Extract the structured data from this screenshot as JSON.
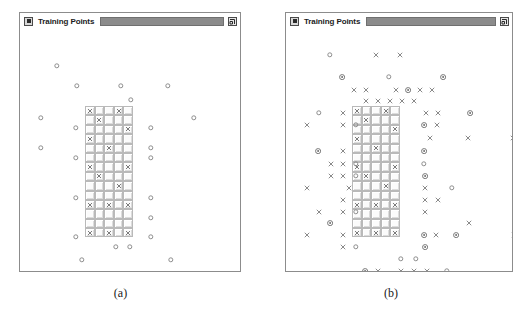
{
  "figure": {
    "panels": [
      {
        "id": "panel-a",
        "caption": "(a)",
        "window": {
          "title": "Training Points",
          "system_button_icon": "square-icon",
          "resize_button_icon": "restore-window-icon"
        },
        "grid": {
          "cols": 5,
          "rows": 14,
          "x_cells": [
            [
              1,
              0,
              0,
              1,
              0
            ],
            [
              0,
              1,
              0,
              0,
              0
            ],
            [
              0,
              0,
              0,
              0,
              1
            ],
            [
              1,
              0,
              0,
              0,
              0
            ],
            [
              0,
              0,
              1,
              0,
              0
            ],
            [
              0,
              0,
              0,
              0,
              0
            ],
            [
              1,
              0,
              0,
              0,
              1
            ],
            [
              0,
              1,
              0,
              0,
              0
            ],
            [
              0,
              0,
              0,
              1,
              0
            ],
            [
              0,
              0,
              0,
              0,
              0
            ],
            [
              1,
              0,
              1,
              0,
              1
            ],
            [
              0,
              0,
              0,
              0,
              0
            ],
            [
              0,
              0,
              0,
              0,
              0
            ],
            [
              1,
              0,
              1,
              0,
              1
            ]
          ]
        },
        "markers": [
          {
            "type": "circle",
            "x": 37,
            "y": 38
          },
          {
            "type": "circle",
            "x": 57,
            "y": 58
          },
          {
            "type": "circle",
            "x": 101,
            "y": 58
          },
          {
            "type": "circle",
            "x": 148,
            "y": 58
          },
          {
            "type": "circle",
            "x": 111,
            "y": 72
          },
          {
            "type": "circle",
            "x": 21,
            "y": 90
          },
          {
            "type": "circle",
            "x": 174,
            "y": 90
          },
          {
            "type": "circle",
            "x": 56,
            "y": 100
          },
          {
            "type": "circle",
            "x": 131,
            "y": 100
          },
          {
            "type": "circle",
            "x": 21,
            "y": 120
          },
          {
            "type": "circle",
            "x": 131,
            "y": 120
          },
          {
            "type": "circle",
            "x": 56,
            "y": 130
          },
          {
            "type": "circle",
            "x": 131,
            "y": 130
          },
          {
            "type": "circle",
            "x": 56,
            "y": 170
          },
          {
            "type": "circle",
            "x": 131,
            "y": 170
          },
          {
            "type": "circle",
            "x": 131,
            "y": 190
          },
          {
            "type": "circle",
            "x": 56,
            "y": 209
          },
          {
            "type": "circle",
            "x": 131,
            "y": 209
          },
          {
            "type": "circle",
            "x": 96,
            "y": 219
          },
          {
            "type": "circle",
            "x": 110,
            "y": 219
          },
          {
            "type": "circle",
            "x": 62,
            "y": 232
          },
          {
            "type": "circle",
            "x": 151,
            "y": 232
          }
        ]
      },
      {
        "id": "panel-b",
        "caption": "(b)",
        "window": {
          "title": "Training Points",
          "system_button_icon": "square-icon",
          "resize_button_icon": "restore-window-icon"
        },
        "grid": {
          "cols": 5,
          "rows": 14,
          "x_cells": [
            [
              1,
              0,
              0,
              1,
              0
            ],
            [
              0,
              1,
              0,
              0,
              0
            ],
            [
              0,
              0,
              0,
              0,
              1
            ],
            [
              1,
              0,
              0,
              0,
              0
            ],
            [
              0,
              0,
              1,
              0,
              0
            ],
            [
              0,
              0,
              0,
              0,
              0
            ],
            [
              1,
              0,
              0,
              0,
              1
            ],
            [
              0,
              1,
              0,
              0,
              0
            ],
            [
              0,
              0,
              0,
              1,
              0
            ],
            [
              0,
              0,
              0,
              0,
              0
            ],
            [
              1,
              0,
              1,
              0,
              1
            ],
            [
              0,
              0,
              0,
              0,
              0
            ],
            [
              0,
              0,
              0,
              0,
              0
            ],
            [
              1,
              0,
              1,
              0,
              1
            ]
          ]
        },
        "markers": [
          {
            "type": "circle",
            "x": 44,
            "y": 27
          },
          {
            "type": "x",
            "x": 90,
            "y": 27
          },
          {
            "type": "x",
            "x": 114,
            "y": 27
          },
          {
            "type": "bullseye",
            "x": 56,
            "y": 49
          },
          {
            "type": "circle",
            "x": 103,
            "y": 49
          },
          {
            "type": "bullseye",
            "x": 157,
            "y": 49
          },
          {
            "type": "x",
            "x": 68,
            "y": 62
          },
          {
            "type": "x",
            "x": 80,
            "y": 62
          },
          {
            "type": "x",
            "x": 110,
            "y": 62
          },
          {
            "type": "bullseye",
            "x": 122,
            "y": 62
          },
          {
            "type": "x",
            "x": 134,
            "y": 62
          },
          {
            "type": "x",
            "x": 146,
            "y": 62
          },
          {
            "type": "x",
            "x": 80,
            "y": 73
          },
          {
            "type": "x",
            "x": 92,
            "y": 73
          },
          {
            "type": "x",
            "x": 104,
            "y": 73
          },
          {
            "type": "x",
            "x": 116,
            "y": 73
          },
          {
            "type": "x",
            "x": 128,
            "y": 73
          },
          {
            "type": "circle",
            "x": 33,
            "y": 85
          },
          {
            "type": "x",
            "x": 57,
            "y": 85
          },
          {
            "type": "x",
            "x": 140,
            "y": 85
          },
          {
            "type": "x",
            "x": 152,
            "y": 85
          },
          {
            "type": "bullseye",
            "x": 184,
            "y": 85
          },
          {
            "type": "x",
            "x": 21,
            "y": 97
          },
          {
            "type": "x",
            "x": 57,
            "y": 97
          },
          {
            "type": "circle",
            "x": 70,
            "y": 97
          },
          {
            "type": "bullseye",
            "x": 138,
            "y": 97
          },
          {
            "type": "x",
            "x": 151,
            "y": 97
          },
          {
            "type": "x",
            "x": 144,
            "y": 110
          },
          {
            "type": "x",
            "x": 182,
            "y": 110
          },
          {
            "type": "x",
            "x": 227,
            "y": 110
          },
          {
            "type": "bullseye",
            "x": 32,
            "y": 123
          },
          {
            "type": "x",
            "x": 57,
            "y": 123
          },
          {
            "type": "bullseye",
            "x": 138,
            "y": 123
          },
          {
            "type": "x",
            "x": 45,
            "y": 136
          },
          {
            "type": "x",
            "x": 57,
            "y": 136
          },
          {
            "type": "circle",
            "x": 70,
            "y": 136
          },
          {
            "type": "circle",
            "x": 138,
            "y": 136
          },
          {
            "type": "x",
            "x": 45,
            "y": 148
          },
          {
            "type": "x",
            "x": 57,
            "y": 148
          },
          {
            "type": "circle",
            "x": 70,
            "y": 148
          },
          {
            "type": "bullseye",
            "x": 139,
            "y": 148
          },
          {
            "type": "x",
            "x": 21,
            "y": 160
          },
          {
            "type": "x",
            "x": 63,
            "y": 160
          },
          {
            "type": "x",
            "x": 139,
            "y": 160
          },
          {
            "type": "circle",
            "x": 166,
            "y": 160
          },
          {
            "type": "x",
            "x": 57,
            "y": 172
          },
          {
            "type": "x",
            "x": 139,
            "y": 172
          },
          {
            "type": "x",
            "x": 152,
            "y": 172
          },
          {
            "type": "x",
            "x": 33,
            "y": 184
          },
          {
            "type": "x",
            "x": 57,
            "y": 184
          },
          {
            "type": "circle",
            "x": 70,
            "y": 184
          },
          {
            "type": "x",
            "x": 139,
            "y": 184
          },
          {
            "type": "bullseye",
            "x": 44,
            "y": 195
          },
          {
            "type": "x",
            "x": 183,
            "y": 195
          },
          {
            "type": "x",
            "x": 21,
            "y": 207
          },
          {
            "type": "x",
            "x": 57,
            "y": 207
          },
          {
            "type": "bullseye",
            "x": 138,
            "y": 207
          },
          {
            "type": "x",
            "x": 150,
            "y": 207
          },
          {
            "type": "bullseye",
            "x": 170,
            "y": 207
          },
          {
            "type": "x",
            "x": 228,
            "y": 207
          },
          {
            "type": "x",
            "x": 57,
            "y": 219
          },
          {
            "type": "circle",
            "x": 70,
            "y": 219
          },
          {
            "type": "bullseye",
            "x": 139,
            "y": 219
          },
          {
            "type": "circle",
            "x": 115,
            "y": 231
          },
          {
            "type": "circle",
            "x": 130,
            "y": 231
          },
          {
            "type": "bullseye",
            "x": 79,
            "y": 243
          },
          {
            "type": "x",
            "x": 92,
            "y": 243
          },
          {
            "type": "x",
            "x": 115,
            "y": 243
          },
          {
            "type": "x",
            "x": 128,
            "y": 243
          },
          {
            "type": "x",
            "x": 141,
            "y": 243
          },
          {
            "type": "circle",
            "x": 161,
            "y": 243
          },
          {
            "type": "x",
            "x": 92,
            "y": 255
          },
          {
            "type": "x",
            "x": 115,
            "y": 255
          }
        ]
      }
    ]
  }
}
